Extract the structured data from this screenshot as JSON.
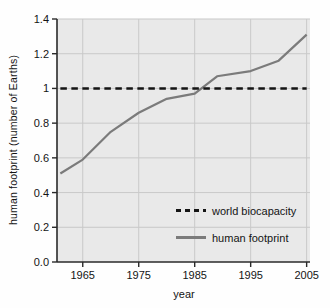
{
  "chart_data": {
    "type": "line",
    "title": "",
    "xlabel": "year",
    "ylabel": "human footprint (number of Earths)",
    "xlim": [
      1961,
      2005
    ],
    "ylim": [
      0,
      1.4
    ],
    "grid": true,
    "legend_position": "inside-bottom-right",
    "x_ticks": [
      1965,
      1975,
      1985,
      1995,
      2005
    ],
    "y_tick_labels": [
      "0.0",
      "0.2",
      "0.4",
      "0.6",
      "0.8",
      "1",
      "1.2",
      "1.4"
    ],
    "y_tick_values": [
      0,
      0.2,
      0.4,
      0.6,
      0.8,
      1.0,
      1.2,
      1.4
    ],
    "series": [
      {
        "name": "world biocapacity",
        "style": "dashed",
        "color": "#141414",
        "x": [
          1961,
          2005
        ],
        "values": [
          1.0,
          1.0
        ]
      },
      {
        "name": "human footprint",
        "style": "solid",
        "color": "#7b7b7b",
        "x": [
          1961,
          1965,
          1970,
          1975,
          1980,
          1985,
          1989,
          1995,
          2000,
          2005
        ],
        "values": [
          0.51,
          0.59,
          0.75,
          0.86,
          0.94,
          0.97,
          1.07,
          1.1,
          1.16,
          1.31
        ]
      }
    ],
    "colors": {
      "plot_bg": "#e9e9e9",
      "grid": "#c9c9c9",
      "axis": "#2a2a2a",
      "text": "#141414"
    }
  }
}
